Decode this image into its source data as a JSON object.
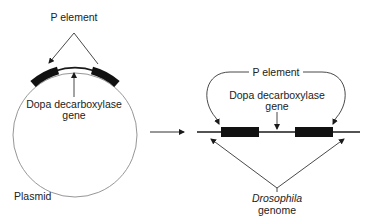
{
  "diagram": {
    "left": {
      "p_element_label": "P element",
      "gene_label_line1": "Dopa decarboxylase",
      "gene_label_line2": "gene",
      "plasmid_label": "Plasmid"
    },
    "right": {
      "p_element_label": "P element",
      "gene_label_line1": "Dopa decarboxylase",
      "gene_label_line2": "gene",
      "genome_label_line1": "Drosophila",
      "genome_label_line2": "genome"
    },
    "colors": {
      "ink": "#1a1a1a",
      "circle": "#8a8a8a",
      "background": "#ffffff"
    }
  }
}
